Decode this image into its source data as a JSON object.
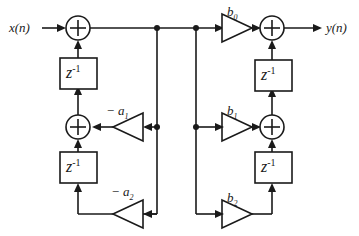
{
  "figure": {
    "type": "signal-flow-diagram",
    "background_color": "#ffffff",
    "line_color": "#1a1a1a"
  },
  "io": {
    "input_label": "x(n)",
    "output_label": "y(n)"
  },
  "delays": {
    "symbol": "z",
    "exponent": "-1",
    "blocks": [
      {
        "id": "feedback-delay-1",
        "label_base": "z",
        "label_exp": "-1"
      },
      {
        "id": "feedback-delay-2",
        "label_base": "z",
        "label_exp": "-1"
      },
      {
        "id": "feedforward-delay-1",
        "label_base": "z",
        "label_exp": "-1"
      },
      {
        "id": "feedforward-delay-2",
        "label_base": "z",
        "label_exp": "-1"
      }
    ]
  },
  "coefficients": {
    "feedback": [
      {
        "id": "coef-neg-a1",
        "sign": "−",
        "base": "a",
        "sub": "1",
        "text": "− a"
      },
      {
        "id": "coef-neg-a2",
        "sign": "−",
        "base": "a",
        "sub": "2",
        "text": "− a"
      }
    ],
    "feedforward": [
      {
        "id": "coef-b0",
        "base": "b",
        "sub": "0",
        "text": "b"
      },
      {
        "id": "coef-b1",
        "base": "b",
        "sub": "1",
        "text": "b"
      },
      {
        "id": "coef-b2",
        "base": "b",
        "sub": "2",
        "text": "b"
      }
    ]
  },
  "adders": [
    {
      "id": "adder-input",
      "symbol": "+"
    },
    {
      "id": "adder-feedback",
      "symbol": "+"
    },
    {
      "id": "adder-output",
      "symbol": "+"
    },
    {
      "id": "adder-feedforward",
      "symbol": "+"
    }
  ]
}
